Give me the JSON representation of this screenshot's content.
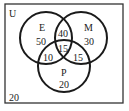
{
  "diagram": {
    "type": "venn-3",
    "universe_label": "U",
    "outside_count": "20",
    "sets": [
      {
        "name": "E",
        "only": "50"
      },
      {
        "name": "M",
        "only": "30"
      },
      {
        "name": "P",
        "only": "20"
      }
    ],
    "regions": {
      "E_only": "50",
      "M_only": "30",
      "P_only": "20",
      "E_and_M_only": "40",
      "E_and_P_only": "10",
      "M_and_P_only": "15",
      "E_M_P": "15",
      "none": "20"
    },
    "colors": {
      "stroke": "#1a1a1a",
      "background": "#ffffff"
    }
  }
}
